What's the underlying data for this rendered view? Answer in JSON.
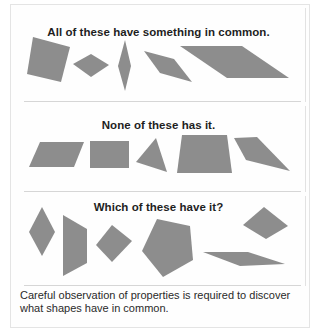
{
  "panels": [
    {
      "title": "All of these have something in common.",
      "role": "examples",
      "shapes": [
        {
          "name": "square-rotated",
          "points": "33,37 70,47 61,82 27,74"
        },
        {
          "name": "rhombus-small",
          "points": "73,64 91,54 109,65 91,77"
        },
        {
          "name": "rhombus-tall",
          "points": "125,40 131,66 125,91 118,66"
        },
        {
          "name": "rhombus-slanted",
          "points": "144,51 174,59 192,82 160,73"
        },
        {
          "name": "parallelogram-wide",
          "points": "180,46 242,46 289,78 227,78"
        }
      ]
    },
    {
      "title": "None of these has it.",
      "role": "non-examples",
      "shapes": [
        {
          "name": "parallelogram",
          "points": "40,142 84,142 74,167 29,167"
        },
        {
          "name": "rectangle",
          "points": "90,141 129,141 129,168 90,168"
        },
        {
          "name": "triangle",
          "points": "156,138 167,172 136,162"
        },
        {
          "name": "trapezoid",
          "points": "182,135 227,135 232,173 177,173"
        },
        {
          "name": "quadrilateral-irregular",
          "points": "234,138 257,137 290,171 246,160"
        }
      ]
    },
    {
      "title": "Which of these have it?",
      "role": "test",
      "shapes": [
        {
          "name": "rhombus-vertical",
          "points": "42,207 55,232 42,256 29,232"
        },
        {
          "name": "quadrilateral-kite",
          "points": "63,215 87,229 87,263 63,276"
        },
        {
          "name": "square-rotated",
          "points": "112,225 132,241 112,262 96,245"
        },
        {
          "name": "pentagon",
          "points": "157,219 190,226 193,260 163,277 142,251"
        },
        {
          "name": "rhombus-slanted",
          "points": "264,207 288,226 266,239 243,225"
        },
        {
          "name": "parallelogram-flat",
          "points": "203,252 248,252 285,264 240,266"
        }
      ]
    }
  ],
  "caption": {
    "line1": "Careful observation of properties is required to discover",
    "line2": "what shapes have in common."
  },
  "colors": {
    "shape_fill": "#8d8d8d",
    "text": "#1e1e1e",
    "border": "#e4e4e4"
  }
}
